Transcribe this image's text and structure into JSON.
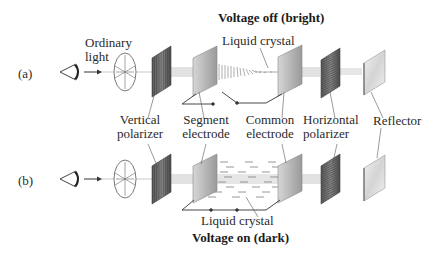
{
  "diagram": {
    "title_top": "Voltage off (bright)",
    "title_bottom": "Voltage on (dark)",
    "row_labels": [
      "(a)",
      "(b)"
    ],
    "labels": {
      "ordinary_light": [
        "Ordinary",
        "light"
      ],
      "liquid_crystal_top": "Liquid crystal",
      "liquid_crystal_bottom": "Liquid crystal",
      "vertical_polarizer": [
        "Vertical",
        "polarizer"
      ],
      "segment_electrode": [
        "Segment",
        "electrode"
      ],
      "common_electrode": [
        "Common",
        "electrode"
      ],
      "horizontal_polarizer": [
        "Horizontal",
        "polarizer"
      ],
      "reflector": "Reflector"
    },
    "colors": {
      "beam": "#e3e3e3",
      "polarizer_dark": "#6e6e6e",
      "electrode": "#c8c8c8",
      "line": "#333333"
    }
  }
}
